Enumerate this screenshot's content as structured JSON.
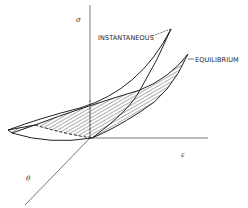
{
  "diagram": {
    "type": "3d-surface-sketch",
    "axes": {
      "vertical": {
        "symbol": "σ",
        "meaning": "stress"
      },
      "horizontal": {
        "symbol": "ε",
        "meaning": "strain"
      },
      "depth": {
        "symbol": "θ",
        "meaning": "temperature"
      }
    },
    "curves": [
      {
        "id": "instantaneous",
        "label": "INSTANTANEOUS"
      },
      {
        "id": "equilibrium",
        "label": "EQUILIBRIUM"
      }
    ],
    "hatched_region": "surface between instantaneous and equilibrium curves"
  },
  "labels": {
    "sigma": "σ",
    "epsilon": "ε",
    "theta": "θ",
    "instantaneous": "INSTANTANEOUS",
    "equilibrium": "EQUILIBRIUM"
  },
  "colors": {
    "line": "#222222",
    "axis": "#555555",
    "background": "#ffffff"
  }
}
